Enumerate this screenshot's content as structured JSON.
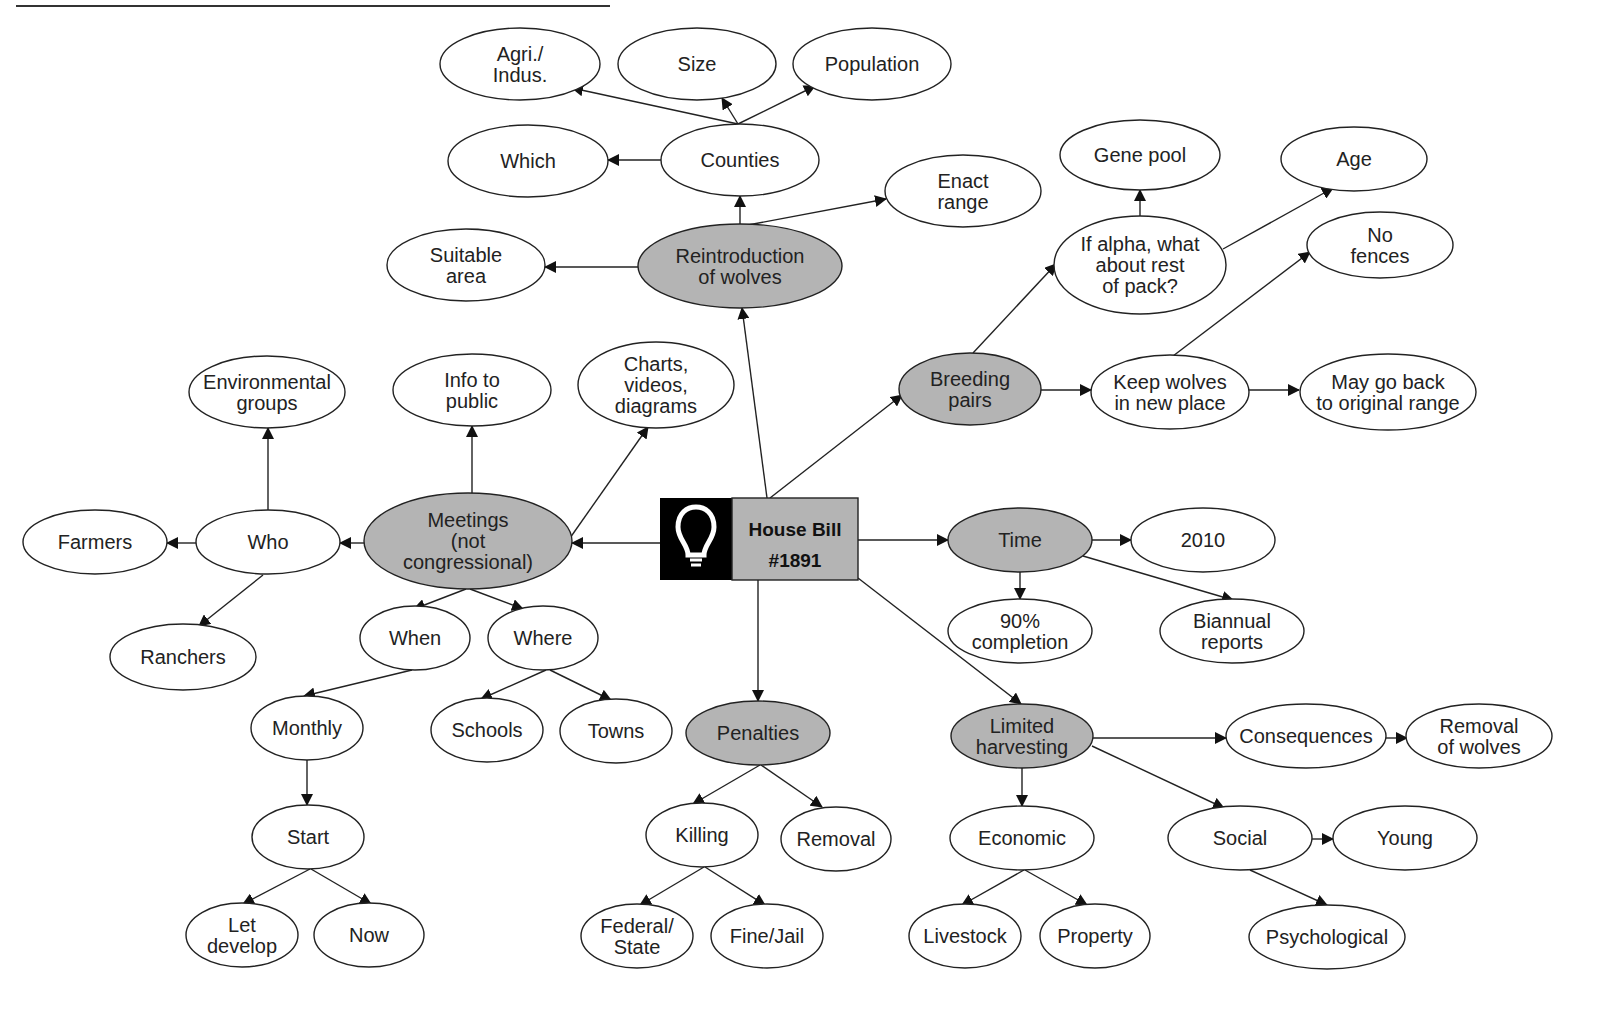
{
  "diagram": {
    "type": "concept-map",
    "center": {
      "id": "house_bill",
      "lines": [
        "House Bill",
        "#1891"
      ],
      "icon": "lightbulb-icon",
      "x": 660,
      "y": 498,
      "w": 198,
      "h": 82,
      "icon_w": 72,
      "icon_bg": "#000000",
      "label_bg": "#b4b4b4"
    },
    "colors": {
      "primary_fill": "#b4b4b4",
      "secondary_fill": "#ffffff",
      "stroke": "#222222"
    },
    "nodes": [
      {
        "id": "reintroduction",
        "lines": [
          "Reintroduction",
          "of wolves"
        ],
        "x": 740,
        "y": 266,
        "rx": 102,
        "ry": 42,
        "style": "primary"
      },
      {
        "id": "counties",
        "lines": [
          "Counties"
        ],
        "x": 740,
        "y": 160,
        "rx": 79,
        "ry": 36,
        "style": "secondary"
      },
      {
        "id": "agri_indus",
        "lines": [
          "Agri./",
          "Indus."
        ],
        "x": 520,
        "y": 64,
        "rx": 80,
        "ry": 36,
        "style": "secondary"
      },
      {
        "id": "size",
        "lines": [
          "Size"
        ],
        "x": 697,
        "y": 64,
        "rx": 79,
        "ry": 36,
        "style": "secondary"
      },
      {
        "id": "population",
        "lines": [
          "Population"
        ],
        "x": 872,
        "y": 64,
        "rx": 79,
        "ry": 36,
        "style": "secondary"
      },
      {
        "id": "which",
        "lines": [
          "Which"
        ],
        "x": 528,
        "y": 161,
        "rx": 80,
        "ry": 36,
        "style": "secondary"
      },
      {
        "id": "enact_range",
        "lines": [
          "Enact",
          "range"
        ],
        "x": 963,
        "y": 191,
        "rx": 78,
        "ry": 36,
        "style": "secondary"
      },
      {
        "id": "suitable_area",
        "lines": [
          "Suitable",
          "area"
        ],
        "x": 466,
        "y": 265,
        "rx": 79,
        "ry": 36,
        "style": "secondary"
      },
      {
        "id": "breeding_pairs",
        "lines": [
          "Breeding",
          "pairs"
        ],
        "x": 970,
        "y": 389,
        "rx": 71,
        "ry": 36,
        "style": "primary"
      },
      {
        "id": "if_alpha",
        "lines": [
          "If alpha, what",
          "about rest",
          "of pack?"
        ],
        "x": 1140,
        "y": 265,
        "rx": 86,
        "ry": 49,
        "style": "secondary"
      },
      {
        "id": "gene_pool",
        "lines": [
          "Gene pool"
        ],
        "x": 1140,
        "y": 155,
        "rx": 80,
        "ry": 35,
        "style": "secondary"
      },
      {
        "id": "age",
        "lines": [
          "Age"
        ],
        "x": 1354,
        "y": 159,
        "rx": 73,
        "ry": 32,
        "style": "secondary"
      },
      {
        "id": "no_fences",
        "lines": [
          "No",
          "fences"
        ],
        "x": 1380,
        "y": 245,
        "rx": 73,
        "ry": 33,
        "style": "secondary"
      },
      {
        "id": "keep_wolves",
        "lines": [
          "Keep wolves",
          "in new place"
        ],
        "x": 1170,
        "y": 392,
        "rx": 79,
        "ry": 37,
        "style": "secondary"
      },
      {
        "id": "may_go_back",
        "lines": [
          "May go back",
          "to original range"
        ],
        "x": 1388,
        "y": 392,
        "rx": 88,
        "ry": 38,
        "style": "secondary"
      },
      {
        "id": "meetings",
        "lines": [
          "Meetings",
          "(not",
          "congressional)"
        ],
        "x": 468,
        "y": 541,
        "rx": 104,
        "ry": 48,
        "style": "primary"
      },
      {
        "id": "who",
        "lines": [
          "Who"
        ],
        "x": 268,
        "y": 542,
        "rx": 72,
        "ry": 32,
        "style": "secondary"
      },
      {
        "id": "farmers",
        "lines": [
          "Farmers"
        ],
        "x": 95,
        "y": 542,
        "rx": 72,
        "ry": 32,
        "style": "secondary"
      },
      {
        "id": "ranchers",
        "lines": [
          "Ranchers"
        ],
        "x": 183,
        "y": 657,
        "rx": 73,
        "ry": 33,
        "style": "secondary"
      },
      {
        "id": "environmental_groups",
        "lines": [
          "Environmental",
          "groups"
        ],
        "x": 267,
        "y": 392,
        "rx": 78,
        "ry": 36,
        "style": "secondary"
      },
      {
        "id": "info_to_public",
        "lines": [
          "Info to",
          "public"
        ],
        "x": 472,
        "y": 390,
        "rx": 79,
        "ry": 36,
        "style": "secondary"
      },
      {
        "id": "charts_videos",
        "lines": [
          "Charts,",
          "videos,",
          "diagrams"
        ],
        "x": 656,
        "y": 385,
        "rx": 78,
        "ry": 43,
        "style": "secondary"
      },
      {
        "id": "when",
        "lines": [
          "When"
        ],
        "x": 415,
        "y": 638,
        "rx": 55,
        "ry": 32,
        "style": "secondary"
      },
      {
        "id": "where",
        "lines": [
          "Where"
        ],
        "x": 543,
        "y": 638,
        "rx": 55,
        "ry": 32,
        "style": "secondary"
      },
      {
        "id": "monthly",
        "lines": [
          "Monthly"
        ],
        "x": 307,
        "y": 728,
        "rx": 56,
        "ry": 32,
        "style": "secondary"
      },
      {
        "id": "start",
        "lines": [
          "Start"
        ],
        "x": 308,
        "y": 837,
        "rx": 56,
        "ry": 32,
        "style": "secondary"
      },
      {
        "id": "let_develop",
        "lines": [
          "Let",
          "develop"
        ],
        "x": 242,
        "y": 935,
        "rx": 56,
        "ry": 32,
        "style": "secondary"
      },
      {
        "id": "now",
        "lines": [
          "Now"
        ],
        "x": 369,
        "y": 935,
        "rx": 55,
        "ry": 32,
        "style": "secondary"
      },
      {
        "id": "schools",
        "lines": [
          "Schools"
        ],
        "x": 487,
        "y": 730,
        "rx": 56,
        "ry": 32,
        "style": "secondary"
      },
      {
        "id": "towns",
        "lines": [
          "Towns"
        ],
        "x": 616,
        "y": 731,
        "rx": 56,
        "ry": 32,
        "style": "secondary"
      },
      {
        "id": "penalties",
        "lines": [
          "Penalties"
        ],
        "x": 758,
        "y": 733,
        "rx": 72,
        "ry": 32,
        "style": "primary"
      },
      {
        "id": "killing",
        "lines": [
          "Killing"
        ],
        "x": 702,
        "y": 835,
        "rx": 56,
        "ry": 32,
        "style": "secondary"
      },
      {
        "id": "removal",
        "lines": [
          "Removal"
        ],
        "x": 836,
        "y": 839,
        "rx": 55,
        "ry": 32,
        "style": "secondary"
      },
      {
        "id": "federal_state",
        "lines": [
          "Federal/",
          "State"
        ],
        "x": 637,
        "y": 936,
        "rx": 56,
        "ry": 32,
        "style": "secondary"
      },
      {
        "id": "fine_jail",
        "lines": [
          "Fine/Jail"
        ],
        "x": 767,
        "y": 936,
        "rx": 56,
        "ry": 32,
        "style": "secondary"
      },
      {
        "id": "time",
        "lines": [
          "Time"
        ],
        "x": 1020,
        "y": 540,
        "rx": 72,
        "ry": 32,
        "style": "primary"
      },
      {
        "id": "y2010",
        "lines": [
          "2010"
        ],
        "x": 1203,
        "y": 540,
        "rx": 72,
        "ry": 32,
        "style": "secondary"
      },
      {
        "id": "completion_90",
        "lines": [
          "90%",
          "completion"
        ],
        "x": 1020,
        "y": 631,
        "rx": 72,
        "ry": 32,
        "style": "secondary"
      },
      {
        "id": "biannual_reports",
        "lines": [
          "Biannual",
          "reports"
        ],
        "x": 1232,
        "y": 631,
        "rx": 72,
        "ry": 32,
        "style": "secondary"
      },
      {
        "id": "limited_harvesting",
        "lines": [
          "Limited",
          "harvesting"
        ],
        "x": 1022,
        "y": 736,
        "rx": 71,
        "ry": 32,
        "style": "primary"
      },
      {
        "id": "consequences",
        "lines": [
          "Consequences"
        ],
        "x": 1306,
        "y": 736,
        "rx": 80,
        "ry": 32,
        "style": "secondary"
      },
      {
        "id": "removal_of_wolves",
        "lines": [
          "Removal",
          "of wolves"
        ],
        "x": 1479,
        "y": 736,
        "rx": 73,
        "ry": 32,
        "style": "secondary"
      },
      {
        "id": "economic",
        "lines": [
          "Economic"
        ],
        "x": 1022,
        "y": 838,
        "rx": 72,
        "ry": 32,
        "style": "secondary"
      },
      {
        "id": "social",
        "lines": [
          "Social"
        ],
        "x": 1240,
        "y": 838,
        "rx": 72,
        "ry": 32,
        "style": "secondary"
      },
      {
        "id": "young",
        "lines": [
          "Young"
        ],
        "x": 1405,
        "y": 838,
        "rx": 72,
        "ry": 32,
        "style": "secondary"
      },
      {
        "id": "livestock",
        "lines": [
          "Livestock"
        ],
        "x": 965,
        "y": 936,
        "rx": 56,
        "ry": 32,
        "style": "secondary"
      },
      {
        "id": "property",
        "lines": [
          "Property"
        ],
        "x": 1095,
        "y": 936,
        "rx": 55,
        "ry": 32,
        "style": "secondary"
      },
      {
        "id": "psychological",
        "lines": [
          "Psychological"
        ],
        "x": 1327,
        "y": 937,
        "rx": 78,
        "ry": 32,
        "style": "secondary"
      }
    ],
    "edges": [
      {
        "from": "house_bill",
        "to": "reintroduction",
        "x1": 767,
        "y1": 498,
        "x2": 742,
        "y2": 308
      },
      {
        "from": "reintroduction",
        "to": "counties",
        "x1": 740,
        "y1": 224,
        "x2": 740,
        "y2": 196
      },
      {
        "from": "counties",
        "to": "agri_indus",
        "x1": 738,
        "y1": 124,
        "x2": 572,
        "y2": 88
      },
      {
        "from": "counties",
        "to": "size",
        "x1": 738,
        "y1": 124,
        "x2": 722,
        "y2": 98
      },
      {
        "from": "counties",
        "to": "population",
        "x1": 738,
        "y1": 124,
        "x2": 815,
        "y2": 86
      },
      {
        "from": "counties",
        "to": "which",
        "x1": 661,
        "y1": 160,
        "x2": 608,
        "y2": 160
      },
      {
        "from": "reintroduction",
        "to": "enact_range",
        "x1": 748,
        "y1": 225,
        "x2": 886,
        "y2": 199
      },
      {
        "from": "reintroduction",
        "to": "suitable_area",
        "x1": 638,
        "y1": 267,
        "x2": 545,
        "y2": 267
      },
      {
        "from": "house_bill",
        "to": "breeding_pairs",
        "x1": 770,
        "y1": 498,
        "x2": 902,
        "y2": 395
      },
      {
        "from": "breeding_pairs",
        "to": "if_alpha",
        "x1": 973,
        "y1": 353,
        "x2": 1056,
        "y2": 264
      },
      {
        "from": "if_alpha",
        "to": "gene_pool",
        "x1": 1140,
        "y1": 216,
        "x2": 1140,
        "y2": 190
      },
      {
        "from": "if_alpha",
        "to": "age",
        "x1": 1223,
        "y1": 249,
        "x2": 1333,
        "y2": 188
      },
      {
        "from": "keep_wolves",
        "to": "no_fences",
        "x1": 1173,
        "y1": 356,
        "x2": 1310,
        "y2": 252
      },
      {
        "from": "breeding_pairs",
        "to": "keep_wolves",
        "x1": 1041,
        "y1": 390,
        "x2": 1091,
        "y2": 390
      },
      {
        "from": "keep_wolves",
        "to": "may_go_back",
        "x1": 1249,
        "y1": 390,
        "x2": 1299,
        "y2": 390
      },
      {
        "from": "house_bill",
        "to": "meetings",
        "x1": 660,
        "y1": 543,
        "x2": 572,
        "y2": 543
      },
      {
        "from": "meetings",
        "to": "who",
        "x1": 364,
        "y1": 543,
        "x2": 340,
        "y2": 543
      },
      {
        "from": "who",
        "to": "farmers",
        "x1": 196,
        "y1": 543,
        "x2": 167,
        "y2": 543
      },
      {
        "from": "who",
        "to": "ranchers",
        "x1": 263,
        "y1": 575,
        "x2": 199,
        "y2": 626
      },
      {
        "from": "who",
        "to": "environmental_groups",
        "x1": 268,
        "y1": 510,
        "x2": 268,
        "y2": 428
      },
      {
        "from": "meetings",
        "to": "info_to_public",
        "x1": 472,
        "y1": 493,
        "x2": 472,
        "y2": 426
      },
      {
        "from": "meetings",
        "to": "charts_videos",
        "x1": 570,
        "y1": 538,
        "x2": 648,
        "y2": 427
      },
      {
        "from": "meetings",
        "to": "when",
        "x1": 466,
        "y1": 589,
        "x2": 414,
        "y2": 609
      },
      {
        "from": "meetings",
        "to": "where",
        "x1": 470,
        "y1": 589,
        "x2": 523,
        "y2": 609
      },
      {
        "from": "when",
        "to": "monthly",
        "x1": 412,
        "y1": 670,
        "x2": 304,
        "y2": 696
      },
      {
        "from": "monthly",
        "to": "start",
        "x1": 307,
        "y1": 760,
        "x2": 307,
        "y2": 805
      },
      {
        "from": "start",
        "to": "let_develop",
        "x1": 310,
        "y1": 869,
        "x2": 243,
        "y2": 904
      },
      {
        "from": "start",
        "to": "now",
        "x1": 311,
        "y1": 869,
        "x2": 371,
        "y2": 904
      },
      {
        "from": "where",
        "to": "schools",
        "x1": 546,
        "y1": 670,
        "x2": 481,
        "y2": 699
      },
      {
        "from": "where",
        "to": "towns",
        "x1": 550,
        "y1": 670,
        "x2": 611,
        "y2": 700
      },
      {
        "from": "house_bill",
        "to": "penalties",
        "x1": 758,
        "y1": 580,
        "x2": 758,
        "y2": 701
      },
      {
        "from": "penalties",
        "to": "killing",
        "x1": 760,
        "y1": 765,
        "x2": 693,
        "y2": 804
      },
      {
        "from": "penalties",
        "to": "removal",
        "x1": 761,
        "y1": 765,
        "x2": 822,
        "y2": 807
      },
      {
        "from": "killing",
        "to": "federal_state",
        "x1": 704,
        "y1": 867,
        "x2": 640,
        "y2": 905
      },
      {
        "from": "killing",
        "to": "fine_jail",
        "x1": 705,
        "y1": 867,
        "x2": 765,
        "y2": 905
      },
      {
        "from": "house_bill",
        "to": "time",
        "x1": 858,
        "y1": 540,
        "x2": 948,
        "y2": 540
      },
      {
        "from": "time",
        "to": "y2010",
        "x1": 1092,
        "y1": 540,
        "x2": 1131,
        "y2": 540
      },
      {
        "from": "time",
        "to": "completion_90",
        "x1": 1020,
        "y1": 572,
        "x2": 1020,
        "y2": 599
      },
      {
        "from": "time",
        "to": "biannual_reports",
        "x1": 1083,
        "y1": 556,
        "x2": 1233,
        "y2": 600
      },
      {
        "from": "house_bill",
        "to": "limited_harvesting",
        "x1": 858,
        "y1": 578,
        "x2": 1021,
        "y2": 704
      },
      {
        "from": "limited_harvesting",
        "to": "consequences",
        "x1": 1093,
        "y1": 738,
        "x2": 1226,
        "y2": 738
      },
      {
        "from": "consequences",
        "to": "removal_of_wolves",
        "x1": 1386,
        "y1": 738,
        "x2": 1407,
        "y2": 738
      },
      {
        "from": "limited_harvesting",
        "to": "economic",
        "x1": 1022,
        "y1": 768,
        "x2": 1022,
        "y2": 806
      },
      {
        "from": "limited_harvesting",
        "to": "social",
        "x1": 1092,
        "y1": 746,
        "x2": 1224,
        "y2": 808
      },
      {
        "from": "social",
        "to": "young",
        "x1": 1312,
        "y1": 839,
        "x2": 1333,
        "y2": 839
      },
      {
        "from": "economic",
        "to": "livestock",
        "x1": 1024,
        "y1": 870,
        "x2": 962,
        "y2": 905
      },
      {
        "from": "economic",
        "to": "property",
        "x1": 1025,
        "y1": 870,
        "x2": 1087,
        "y2": 905
      },
      {
        "from": "social",
        "to": "psychological",
        "x1": 1250,
        "y1": 870,
        "x2": 1327,
        "y2": 905
      }
    ]
  }
}
